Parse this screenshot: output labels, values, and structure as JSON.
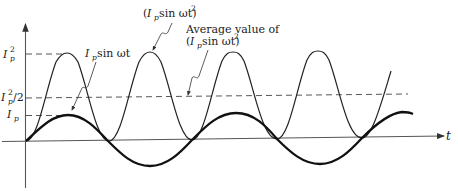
{
  "diagram": {
    "type": "waveform-plot",
    "colors": {
      "background": "#ffffff",
      "ink": "#222222",
      "axis": "#555555",
      "dash": "#444444"
    },
    "axes": {
      "x_label": "t",
      "y_ticks": [
        {
          "id": "ip2",
          "base": "I",
          "sub": "p",
          "sup": "2",
          "suffix": ""
        },
        {
          "id": "ip2half",
          "base": "I",
          "sub": "p",
          "sup": "2",
          "suffix": "/2"
        },
        {
          "id": "ip",
          "base": "I",
          "sub": "p",
          "sup": "",
          "suffix": ""
        }
      ]
    },
    "curves": [
      {
        "id": "sine",
        "label": "I_p sin ωt",
        "style": "thick"
      },
      {
        "id": "sine-squared",
        "label": "(I_p sin ωt)^2",
        "style": "thin"
      }
    ],
    "annotations": {
      "sine_label": {
        "base": "I",
        "sub": "p",
        "rest": " sin ωt"
      },
      "squared_label": {
        "open": "(",
        "base": "I",
        "sub": "p",
        "rest": " sin ωt)",
        "sup": "2"
      },
      "average_label": {
        "line1": "Average value of",
        "open": "(",
        "base": "I",
        "sub": "p",
        "rest": " sin ωt)",
        "sup": "2"
      }
    },
    "reference_lines": [
      {
        "id": "peak-squared",
        "level": "Ip^2"
      },
      {
        "id": "average",
        "level": "Ip^2/2"
      },
      {
        "id": "peak",
        "level": "Ip"
      }
    ]
  }
}
